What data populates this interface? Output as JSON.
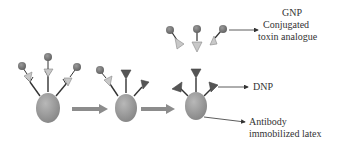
{
  "labels": {
    "gnp": "GNP",
    "conjugated": "Conjugated",
    "toxin_analogue": "toxin analogue",
    "dnp": "DNP",
    "antibody": "Antibody",
    "immobilized_latex": "immobilized latex"
  },
  "colors": {
    "latex_bead": "#9a9a9a",
    "gnp_particle": "#7a7a7a",
    "toxin_analogue": "#c4c4c4",
    "dnp": "#555555",
    "antibody_stem": "#333333",
    "process_arrow": "#8c8c8c",
    "pointer_line": "#333333"
  },
  "stages": [
    {
      "name": "stage-1",
      "description": "Latex bead with three antibodies each bound to GNP-conjugated toxin analogue"
    },
    {
      "name": "stage-2",
      "description": "Partial displacement: one GNP-toxin analogue remains, two sites bound by DNP"
    },
    {
      "name": "stage-3",
      "description": "All antibody sites bound by DNP"
    }
  ]
}
